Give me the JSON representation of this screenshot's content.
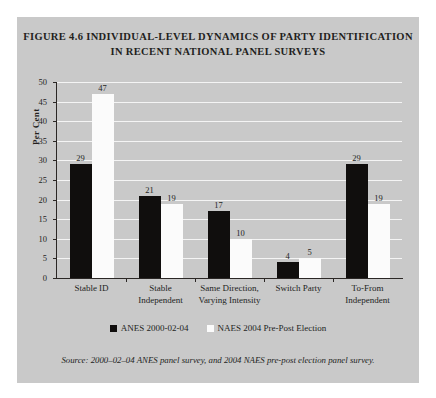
{
  "figure": {
    "title_line_1": "FIGURE 4.6 INDIVIDUAL-LEVEL DYNAMICS OF PARTY IDENTIFICATION",
    "title_line_2": "IN RECENT NATIONAL PANEL SURVEYS",
    "source": "Source: 2000–02–04 ANES panel survey, and 2004 NAES pre-post election panel survey.",
    "panel_color": "#c9c9c9",
    "page_color": "#ffffff"
  },
  "chart_data": {
    "type": "bar",
    "title": "FIGURE 4.6 INDIVIDUAL-LEVEL DYNAMICS OF PARTY IDENTIFICATION IN RECENT NATIONAL PANEL SURVEYS",
    "xlabel": "",
    "ylabel": "Per Cent",
    "ylim": [
      0,
      50
    ],
    "yticks": [
      0,
      5,
      10,
      15,
      20,
      25,
      30,
      35,
      40,
      45,
      50
    ],
    "ytick_labels": [
      "0",
      "5",
      "10",
      "15",
      "20",
      "25",
      "30",
      "35",
      "40",
      "45",
      "50"
    ],
    "grid": true,
    "legend_position": "bottom",
    "categories": [
      "Stable ID",
      "Stable Independent",
      "Same Direction, Varying Intensity",
      "Switch Party",
      "To-From Independent"
    ],
    "category_lines": [
      [
        "Stable ID"
      ],
      [
        "Stable",
        "Independent"
      ],
      [
        "Same Direction,",
        "Varying Intensity"
      ],
      [
        "Switch Party"
      ],
      [
        "To-From",
        "Independent"
      ]
    ],
    "series": [
      {
        "name": "ANES 2000-02-04",
        "color": "#100e0d",
        "values": [
          29,
          21,
          17,
          4,
          29
        ]
      },
      {
        "name": "NAES 2004 Pre-Post Election",
        "color": "#fbfbfb",
        "values": [
          47,
          19,
          10,
          5,
          19
        ]
      }
    ]
  }
}
